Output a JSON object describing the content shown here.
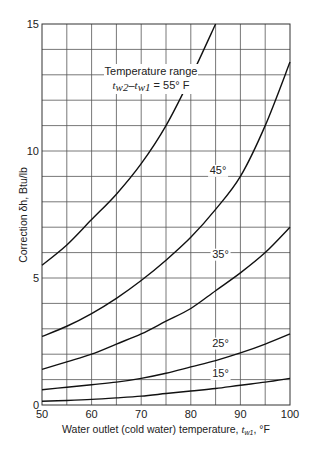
{
  "chart_data": {
    "type": "line",
    "title": "",
    "xlabel": "Water outlet (cold water) temperature, t_w1, °F",
    "ylabel": "Correction δh, Btu/lb",
    "xlim": [
      50,
      100
    ],
    "ylim": [
      0,
      15
    ],
    "x_ticks": [
      50,
      60,
      70,
      80,
      90,
      100
    ],
    "y_ticks": [
      0,
      5,
      10,
      15
    ],
    "x_grid_step": 5,
    "y_grid_step": 1,
    "grid": true,
    "legend": "inline curve labels",
    "annotation": {
      "line1": "Temperature range",
      "line2_prefix": "t",
      "line2": "w2–tw1 = 55° F"
    },
    "series": [
      {
        "name": "55°",
        "x": [
          50,
          55,
          60,
          65,
          70,
          75,
          80,
          85
        ],
        "values": [
          5.5,
          6.3,
          7.3,
          8.3,
          9.5,
          11.0,
          12.9,
          15.0
        ]
      },
      {
        "name": "45°",
        "x": [
          50,
          55,
          60,
          65,
          70,
          75,
          80,
          85,
          90,
          95,
          100
        ],
        "values": [
          2.7,
          3.1,
          3.6,
          4.2,
          4.9,
          5.7,
          6.6,
          7.7,
          9.0,
          11.0,
          13.5
        ]
      },
      {
        "name": "35°",
        "x": [
          50,
          55,
          60,
          65,
          70,
          75,
          80,
          85,
          90,
          95,
          100
        ],
        "values": [
          1.4,
          1.7,
          2.0,
          2.4,
          2.8,
          3.3,
          3.8,
          4.5,
          5.2,
          6.0,
          7.0
        ]
      },
      {
        "name": "25°",
        "x": [
          50,
          55,
          60,
          65,
          70,
          75,
          80,
          85,
          90,
          95,
          100
        ],
        "values": [
          0.6,
          0.7,
          0.8,
          0.9,
          1.05,
          1.25,
          1.5,
          1.75,
          2.05,
          2.4,
          2.8
        ]
      },
      {
        "name": "15°",
        "x": [
          50,
          55,
          60,
          65,
          70,
          75,
          80,
          85,
          90,
          95,
          100
        ],
        "values": [
          0.15,
          0.18,
          0.22,
          0.28,
          0.35,
          0.45,
          0.55,
          0.65,
          0.78,
          0.9,
          1.05
        ]
      }
    ],
    "curve_labels": [
      {
        "text": "Temperature range",
        "x": 72.5,
        "y": 12.9
      },
      {
        "text": "45°",
        "x": 85.5,
        "y": 9.1
      },
      {
        "text": "35°",
        "x": 86,
        "y": 5.8
      },
      {
        "text": "25°",
        "x": 86,
        "y": 2.3
      },
      {
        "text": "15°",
        "x": 86,
        "y": 1.1
      }
    ]
  }
}
